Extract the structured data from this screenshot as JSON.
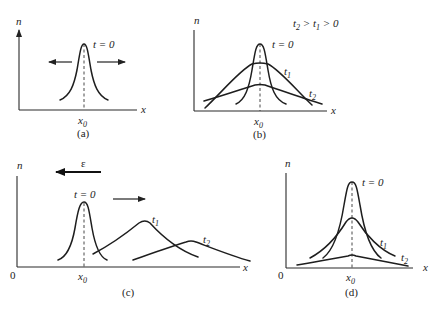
{
  "figure": {
    "panels": [
      {
        "id": "a",
        "caption": "(a)",
        "y_label": "n",
        "x_label": "x",
        "x0_label": "x",
        "x0_sub": "0",
        "curve_labels": [
          {
            "t": "t = 0"
          }
        ],
        "annotation": "arrows pointing outward left and right from peak (diffusion)"
      },
      {
        "id": "b",
        "caption": "(b)",
        "y_label": "n",
        "x_label": "x",
        "x0_label": "x",
        "x0_sub": "0",
        "condition": "t₂ > t₁ > 0",
        "curve_labels": [
          {
            "t": "t = 0"
          },
          {
            "t": "t",
            "sub": "1"
          },
          {
            "t": "t",
            "sub": "2"
          }
        ]
      },
      {
        "id": "c",
        "caption": "(c)",
        "y_label": "n",
        "x_label": "x",
        "origin_label": "0",
        "x0_label": "x",
        "x0_sub": "0",
        "field_label": "ε",
        "curve_labels": [
          {
            "t": "t = 0"
          },
          {
            "t": "t",
            "sub": "1"
          },
          {
            "t": "t",
            "sub": "2"
          }
        ],
        "annotation": "field arrow points left; drift arrow points right"
      },
      {
        "id": "d",
        "caption": "(d)",
        "y_label": "n",
        "x_label": "x",
        "origin_label": "0",
        "x0_label": "x",
        "x0_sub": "0",
        "curve_labels": [
          {
            "t": "t = 0"
          },
          {
            "t": "t",
            "sub": "1"
          },
          {
            "t": "t",
            "sub": "2"
          }
        ]
      }
    ]
  },
  "text": {
    "a_n": "n",
    "a_x": "x",
    "a_t0": "t = 0",
    "a_x0": "x",
    "a_x0s": "0",
    "a_cap": "(a)",
    "b_n": "n",
    "b_x": "x",
    "b_t0": "t = 0",
    "b_t1": "t",
    "b_t1s": "1",
    "b_t2": "t",
    "b_t2s": "2",
    "b_x0": "x",
    "b_x0s": "0",
    "b_cap": "(b)",
    "b_cond_t2": "t",
    "b_cond_t2s": "2",
    "b_cond_gt1": " > ",
    "b_cond_t1": "t",
    "b_cond_t1s": "1",
    "b_cond_gt0": " > 0",
    "c_n": "n",
    "c_x": "x",
    "c_zero": "0",
    "c_eps": "ε",
    "c_t0": "t = 0",
    "c_t1": "t",
    "c_t1s": "1",
    "c_t2": "t",
    "c_t2s": "2",
    "c_x0": "x",
    "c_x0s": "0",
    "c_cap": "(c)",
    "d_n": "n",
    "d_x": "x",
    "d_zero": "0",
    "d_t0": "t = 0",
    "d_t1": "t",
    "d_t1s": "1",
    "d_t2": "t",
    "d_t2s": "2",
    "d_x0": "x",
    "d_x0s": "0",
    "d_cap": "(d)"
  }
}
